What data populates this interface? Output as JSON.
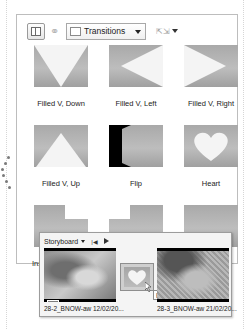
{
  "toolbar": {
    "layout_button_icon": "panel-layout-icon",
    "link_icon": "link-icon",
    "collection_combo": {
      "value": "Transitions",
      "icon": "transition-icon"
    },
    "resize_button_icon": "resize-icon"
  },
  "transitions": [
    {
      "label": "Filled V, Down",
      "shape": "v-down"
    },
    {
      "label": "Filled V, Left",
      "shape": "v-left"
    },
    {
      "label": "Filled V, Right",
      "shape": "v-right"
    },
    {
      "label": "Filled V, Up",
      "shape": "v-up"
    },
    {
      "label": "Flip",
      "shape": "flip"
    },
    {
      "label": "Heart",
      "shape": "heart"
    },
    {
      "label": "Ins",
      "shape": "inset"
    },
    {
      "label": "",
      "shape": "inset2"
    },
    {
      "label": "",
      "shape": "plain"
    }
  ],
  "storyboard": {
    "mode_label": "Storyboard",
    "prev_icon": "skip-back-icon",
    "play_icon": "play-icon",
    "clips": [
      {
        "name": "28-2_BNOW-aw 12/02/20..."
      },
      {
        "name": "28-3_BNOW-aw 21/02/20..."
      }
    ],
    "transition_tooltip": "Heart",
    "star_badge_icon": "star-icon"
  }
}
